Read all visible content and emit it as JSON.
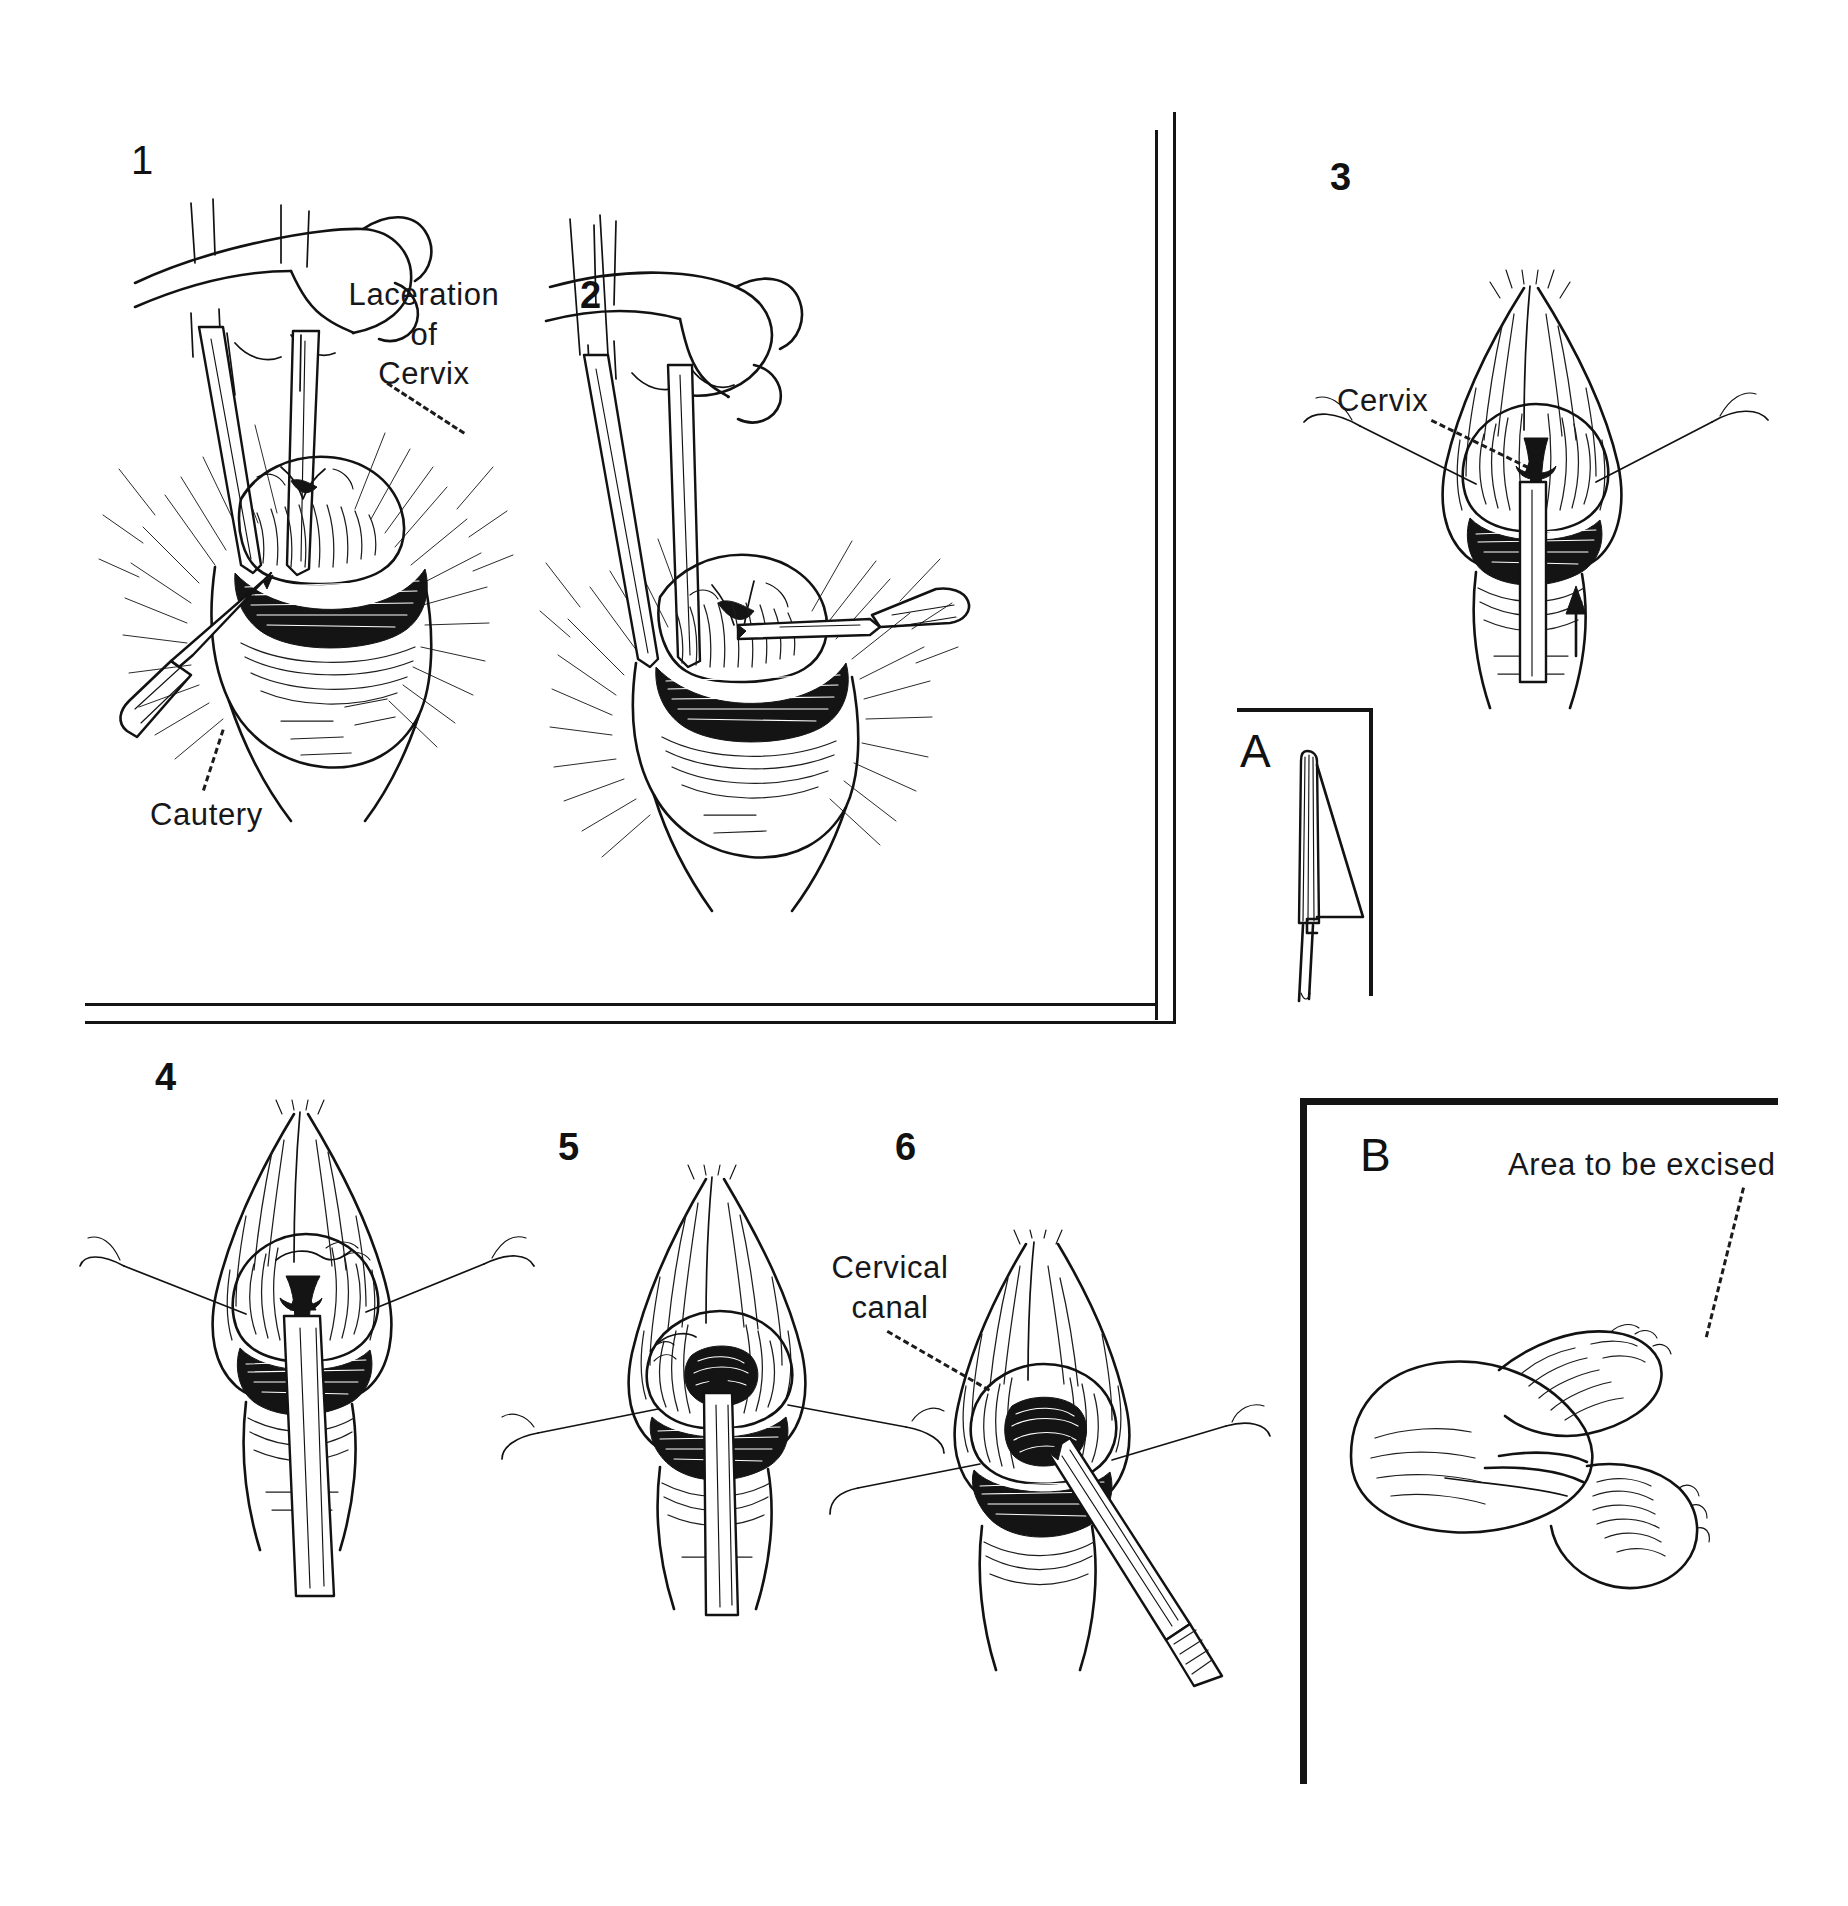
{
  "plate": {
    "title": "Repair of cervical laceration — six-step surgical sequence with detail insets",
    "background_color": "#ffffff",
    "ink_color": "#121212",
    "width": 1848,
    "height": 1906
  },
  "frames": [
    {
      "name": "upper-left-double-rule-frame",
      "description": "Double L-shaped rule enclosing panels 1 and 2 on the right and bottom"
    },
    {
      "name": "inset-a-corner-rule",
      "description": "L-shaped corner rule around inset A"
    },
    {
      "name": "inset-b-rule",
      "description": "L-shaped rule around inset B, thick top and left"
    }
  ],
  "panels": [
    {
      "id": "panel-1",
      "number": "1",
      "caption_labels": [
        "Laceration of Cervix",
        "Cautery"
      ],
      "description": "Gloved hand holding ring forceps inserted through vaginal introitus; cautery pencil applied to bleeding laceration edge"
    },
    {
      "id": "panel-2",
      "number": "2",
      "caption_labels": [],
      "description": "Gloved hand with forceps steadying cervix while cautery tip is applied from the right side"
    },
    {
      "id": "panel-3",
      "number": "3",
      "caption_labels": [
        "Cervix"
      ],
      "description": "Cervix exposed between retractors with traction sutures on each side and probe advanced into canal; arrow indicates direction of traction"
    },
    {
      "id": "panel-4",
      "number": "4",
      "caption_labels": [],
      "description": "Cervix drawn down with instrument in canal, lacerated tissue visible at the os"
    },
    {
      "id": "panel-5",
      "number": "5",
      "caption_labels": [],
      "description": "Closer view of the cervical os after excision of scarred margins, retracting sutures laterally"
    },
    {
      "id": "panel-6",
      "number": "6",
      "caption_labels": [
        "Cervical canal"
      ],
      "description": "Dilator/forceps entering the reconstructed cervical canal"
    }
  ],
  "insets": [
    {
      "id": "inset-a",
      "letter": "A",
      "caption_labels": [],
      "description": "Enlarged side view of the scalpel blade and handle used for the excision"
    },
    {
      "id": "inset-b",
      "letter": "B",
      "caption_labels": [
        "Area to be excised"
      ],
      "description": "Sagittal view of cervix showing the wedge of scarred tissue marked for excision"
    }
  ],
  "annotations": {
    "laceration_of_cervix": {
      "lines": [
        "Laceration",
        "of",
        "Cervix"
      ],
      "text": "Laceration\nof\nCervix"
    },
    "cautery": {
      "text": "Cautery"
    },
    "cervix": {
      "text": "Cervix"
    },
    "cervical_canal": {
      "lines": [
        "Cervical",
        "canal"
      ],
      "text": "Cervical\ncanal"
    },
    "area_to_be_excised": {
      "text": "Area to be excised"
    }
  },
  "numbers": {
    "one": "1",
    "two": "2",
    "three": "3",
    "four": "4",
    "five": "5",
    "six": "6"
  },
  "letters": {
    "a": "A",
    "b": "B"
  }
}
